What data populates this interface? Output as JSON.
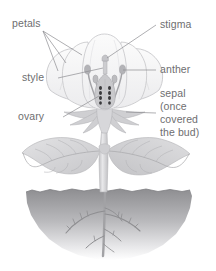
{
  "diagram": {
    "background_color": "#ffffff"
  },
  "labels": {
    "petals": "petals",
    "stigma": "stigma",
    "style": "style",
    "anther": "anther",
    "ovary": "ovary",
    "sepal_line1": "sepal",
    "sepal_line2": "(once",
    "sepal_line3": "covered",
    "sepal_line4": "the bud)"
  },
  "colors": {
    "label_text": "#6e6e70",
    "leader_line": "#8d8d90",
    "petal_fill": "#f2f2f3",
    "petal_stroke": "#c9c9cc",
    "sepal_fill": "#d2d2d5",
    "stem_fill": "#d8d8da",
    "leaf_fill": "#d4d4d6",
    "leaf_stroke": "#b9b9bc",
    "ovary_fill": "#c6c6c9",
    "ovule_dark": "#3c3c3e",
    "filament": "#9a9a9e",
    "anther_head": "#b0b0b4",
    "soil_top": "#929295",
    "soil_bottom": "#ffffff",
    "root_fill": "#8e8e91"
  },
  "parts": [
    {
      "name": "petals",
      "count": 5,
      "region": "upper flower"
    },
    {
      "name": "stigma",
      "count": 1,
      "region": "top of pistil"
    },
    {
      "name": "style",
      "count": 1,
      "region": "pistil stalk"
    },
    {
      "name": "anther",
      "count": 4,
      "region": "stamen tips"
    },
    {
      "name": "ovary",
      "count": 1,
      "region": "base of pistil"
    },
    {
      "name": "sepal",
      "count": 6,
      "region": "below petals"
    },
    {
      "name": "leaf",
      "count": 2,
      "region": "stem"
    },
    {
      "name": "root",
      "count": 1,
      "region": "below soil"
    }
  ]
}
